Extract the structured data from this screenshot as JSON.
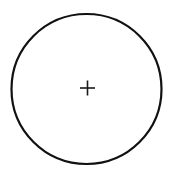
{
  "canvas": {
    "width": 175,
    "height": 176,
    "background_color": "#ffffff",
    "title": "Circle with center cross mark"
  },
  "chart_data": {
    "type": "diagram",
    "title": "",
    "subtitle": "",
    "xlabel": "",
    "ylabel": "",
    "grid": false,
    "legend": null,
    "annotations": [],
    "shapes": [
      {
        "name": "outer-circle",
        "kind": "circle",
        "cx": 86.5,
        "cy": 89,
        "r": 75,
        "stroke_color": "#111111",
        "stroke_width": 2.2,
        "fill": "none"
      },
      {
        "name": "center-cross-horizontal",
        "kind": "line",
        "x1": 80,
        "y1": 88,
        "x2": 95,
        "y2": 88,
        "stroke_color": "#1a1a1a",
        "stroke_width": 1.6
      },
      {
        "name": "center-cross-vertical",
        "kind": "line",
        "x1": 87.5,
        "y1": 80.5,
        "x2": 87.5,
        "y2": 95.5,
        "stroke_color": "#1a1a1a",
        "stroke_width": 1.6
      }
    ]
  },
  "colors": {
    "stroke": "#111111",
    "cross_stroke": "#1a1a1a",
    "background": "#ffffff"
  },
  "labels": {
    "circle_label": "",
    "center_mark_label": ""
  }
}
